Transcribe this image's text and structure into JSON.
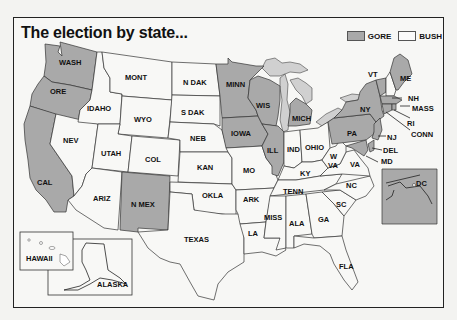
{
  "title": "The election by state...",
  "legend": [
    {
      "label": "GORE",
      "color": "#a9a9a9"
    },
    {
      "label": "BUSH",
      "color": "#fafafa"
    }
  ],
  "colors": {
    "gore": "#a9a9a9",
    "bush": "#f8f8f6",
    "lakes": "#d0d0d0",
    "border": "#333333",
    "background": "#f3f3f1"
  },
  "states": {
    "WASH": "GORE",
    "ORE": "GORE",
    "CAL": "GORE",
    "NEV": "BUSH",
    "IDAHO": "BUSH",
    "MONT": "BUSH",
    "WYO": "BUSH",
    "UTAH": "BUSH",
    "COL": "BUSH",
    "ARIZ": "BUSH",
    "N MEX": "GORE",
    "N DAK": "BUSH",
    "S DAK": "BUSH",
    "NEB": "BUSH",
    "KAN": "BUSH",
    "OKLA": "BUSH",
    "TEXAS": "BUSH",
    "MINN": "GORE",
    "IOWA": "GORE",
    "MO": "BUSH",
    "ARK": "BUSH",
    "LA": "BUSH",
    "WIS": "GORE",
    "ILL": "GORE",
    "MICH": "GORE",
    "IND": "BUSH",
    "OHIO": "BUSH",
    "KY": "BUSH",
    "TENN": "BUSH",
    "MISS": "BUSH",
    "ALA": "BUSH",
    "GA": "BUSH",
    "FLA": "BUSH",
    "SC": "BUSH",
    "NC": "BUSH",
    "VA": "BUSH",
    "W VA": "BUSH",
    "PA": "GORE",
    "NY": "GORE",
    "VT": "GORE",
    "NH": "BUSH",
    "ME": "GORE",
    "MASS": "GORE",
    "RI": "GORE",
    "CONN": "GORE",
    "NJ": "GORE",
    "DEL": "GORE",
    "MD": "GORE",
    "DC": "GORE",
    "HAWAII": "GORE",
    "ALASKA": "BUSH"
  },
  "labels": {
    "wash": "WASH",
    "ore": "ORE",
    "cal": "CAL",
    "nev": "NEV",
    "idaho": "IDAHO",
    "mont": "MONT",
    "wyo": "WYO",
    "utah": "UTAH",
    "col": "COL",
    "ariz": "ARIZ",
    "nmex": "N MEX",
    "ndak": "N DAK",
    "sdak": "S DAK",
    "neb": "NEB",
    "kan": "KAN",
    "okla": "OKLA",
    "texas": "TEXAS",
    "minn": "MINN",
    "iowa": "IOWA",
    "mo": "MO",
    "ark": "ARK",
    "la": "LA",
    "wis": "WIS",
    "ill": "ILL",
    "mich": "MICH",
    "ind": "IND",
    "ohio": "OHIO",
    "ky": "KY",
    "tenn": "TENN",
    "miss": "MISS",
    "ala": "ALA",
    "ga": "GA",
    "fla": "FLA",
    "sc": "SC",
    "nc": "NC",
    "va": "VA",
    "wva_w": "W",
    "wva_va": "VA",
    "pa": "PA",
    "ny": "NY",
    "vt": "VT",
    "nh": "NH",
    "me": "ME",
    "mass": "MASS",
    "ri": "RI",
    "conn": "CONN",
    "nj": "NJ",
    "del": "DEL",
    "md": "MD",
    "dc": "DC",
    "hawaii": "HAWAII",
    "alaska": "ALASKA"
  }
}
